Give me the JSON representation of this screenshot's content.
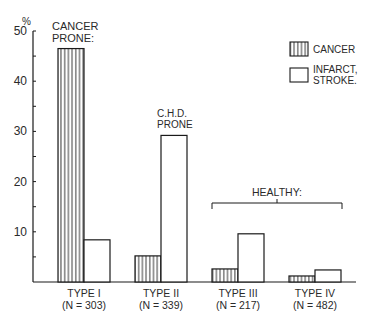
{
  "chart_data": {
    "type": "bar",
    "title": "",
    "xlabel": "",
    "ylabel": "%",
    "ylim": [
      0,
      50
    ],
    "yticks": [
      10,
      20,
      30,
      40,
      50
    ],
    "grid": false,
    "legend_position": "top-right",
    "categories": [
      "TYPE I",
      "TYPE II",
      "TYPE III",
      "TYPE IV"
    ],
    "category_sublabels": [
      "(N = 303)",
      "(N = 339)",
      "(N = 217)",
      "(N = 482)"
    ],
    "series": [
      {
        "name": "CANCER",
        "pattern": "vertical-hatch",
        "values": [
          46.5,
          5.2,
          2.6,
          1.2
        ]
      },
      {
        "name": "INFARCT, STROKE.",
        "pattern": "open",
        "values": [
          8.4,
          29.2,
          9.6,
          2.4
        ]
      }
    ],
    "annotations": [
      {
        "text_lines": [
          "CANCER",
          "PRONE:"
        ],
        "target": "TYPE I"
      },
      {
        "text_lines": [
          "C.H.D.",
          "PRONE"
        ],
        "target": "TYPE II"
      },
      {
        "text_lines": [
          "HEALTHY:"
        ],
        "target": "TYPE III–TYPE IV",
        "bracket": true
      }
    ]
  },
  "legend": {
    "items": [
      {
        "label_lines": [
          "CANCER"
        ]
      },
      {
        "label_lines": [
          "INFARCT,",
          "STROKE."
        ]
      }
    ]
  }
}
